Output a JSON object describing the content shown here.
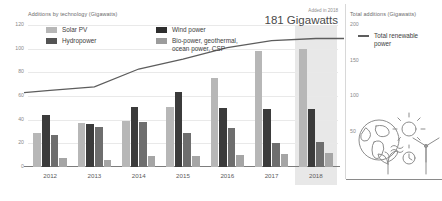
{
  "left": {
    "axis_title": "Additions by technology (Gigawatts)",
    "y_ticks": [
      "120",
      "100",
      "80",
      "60",
      "40",
      "20",
      "0"
    ],
    "legend": [
      {
        "label": "Solar PV",
        "color": "#b7b7b7",
        "swatch": "solar-pv-swatch"
      },
      {
        "label": "Hydropower",
        "color": "#545454",
        "swatch": "hydropower-swatch"
      },
      {
        "label": "Wind power",
        "color": "#2e2e2e",
        "swatch": "wind-power-swatch"
      },
      {
        "label": "Bio-power, geothermal,\nocean power, CSP",
        "color": "#9c9c9c",
        "swatch": "bio-power-swatch"
      }
    ],
    "callout_label": "Added in 2018",
    "callout_value": "181 Gigawatts"
  },
  "right": {
    "axis_title": "Total additions (Gigawatts)",
    "y_ticks": [
      "200",
      "150",
      "100",
      "50"
    ],
    "legend_label": "Total renewable\npower",
    "legend_color": "#5d5d5d"
  },
  "chart_data": {
    "type": "bar",
    "title": "Additions by technology (Gigawatts)",
    "xlabel": "",
    "ylabel": "Additions by technology (Gigawatts)",
    "ylim": [
      0,
      120
    ],
    "y2label": "Total additions (Gigawatts)",
    "y2lim": [
      0,
      200
    ],
    "grid": true,
    "legend_position": "top-left",
    "highlighted_category": "2018",
    "categories": [
      "2012",
      "2013",
      "2014",
      "2015",
      "2016",
      "2017",
      "2018"
    ],
    "series": [
      {
        "name": "Solar PV",
        "color": "#b7b7b7",
        "values": [
          29,
          37,
          39,
          51,
          75,
          98,
          100
        ]
      },
      {
        "name": "Hydropower",
        "color": "#3b3b3b",
        "values": [
          44,
          36,
          51,
          63,
          50,
          49,
          49
        ]
      },
      {
        "name": "Wind power",
        "color": "#6e6e6e",
        "values": [
          27,
          34,
          38,
          29,
          33,
          20,
          21
        ]
      },
      {
        "name": "Bio-power, geothermal, ocean power, CSP",
        "color": "#a5a5a5",
        "values": [
          8,
          6,
          9,
          9,
          10,
          11,
          12
        ]
      }
    ],
    "line_series": {
      "name": "Total renewable power",
      "color": "#5d5d5d",
      "axis": "y2",
      "values": [
        108,
        113,
        138,
        152,
        168,
        178,
        181
      ]
    },
    "annotations": [
      {
        "text": "Added in 2018",
        "value": "181 Gigawatts"
      }
    ]
  }
}
